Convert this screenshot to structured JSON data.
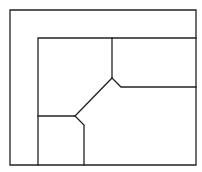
{
  "diagram": {
    "type": "floor-plan-line-drawing",
    "canvas": {
      "width": 202,
      "height": 172,
      "background": "#ffffff"
    },
    "stroke_color": "#222222",
    "outer_frame": {
      "x1": 10,
      "y1": 10,
      "x2": 196,
      "y2": 165
    },
    "inner_frame": {
      "left": 38,
      "top": 38,
      "right": 196,
      "bottom": 165
    },
    "segments": [
      {
        "name": "top-room-divider",
        "points": [
          [
            112,
            38
          ],
          [
            112,
            78
          ]
        ]
      },
      {
        "name": "upper-right-room-bottom",
        "points": [
          [
            112,
            78
          ],
          [
            121,
            87
          ],
          [
            196,
            87
          ]
        ]
      },
      {
        "name": "central-diagonal",
        "points": [
          [
            112,
            78
          ],
          [
            75,
            116
          ]
        ]
      },
      {
        "name": "lower-left-room-top",
        "points": [
          [
            38,
            116
          ],
          [
            75,
            116
          ]
        ]
      },
      {
        "name": "lower-left-room-right",
        "points": [
          [
            75,
            116
          ],
          [
            84,
            125
          ],
          [
            84,
            165
          ]
        ]
      }
    ]
  }
}
